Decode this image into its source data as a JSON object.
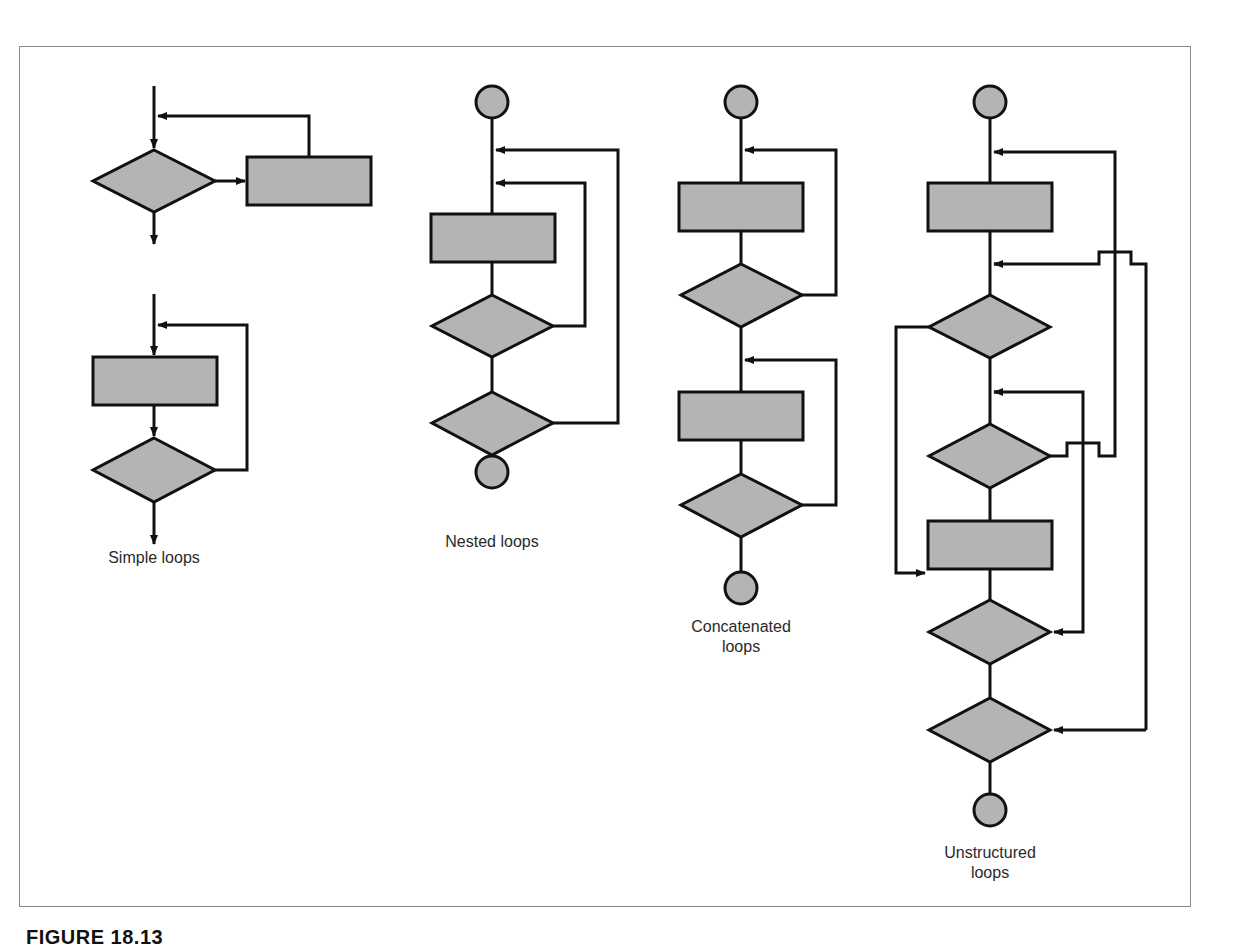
{
  "figure": {
    "caption": "FIGURE 18.13",
    "frame_color": "#8a8a8a",
    "shape_fill": "#b4b4b4",
    "stroke_color": "#111111"
  },
  "groups": [
    {
      "id": "simple",
      "label": "Simple loops",
      "shapes": [
        "decision",
        "process",
        "process",
        "decision"
      ]
    },
    {
      "id": "nested",
      "label": "Nested loops",
      "shapes": [
        "start",
        "process",
        "decision",
        "decision",
        "end"
      ]
    },
    {
      "id": "concatenated",
      "label_line1": "Concatenated",
      "label_line2": "loops",
      "shapes": [
        "start",
        "process",
        "decision",
        "process",
        "decision",
        "end"
      ]
    },
    {
      "id": "unstructured",
      "label_line1": "Unstructured",
      "label_line2": "loops",
      "shapes": [
        "start",
        "process",
        "decision",
        "decision",
        "process",
        "decision",
        "decision",
        "end"
      ]
    }
  ]
}
